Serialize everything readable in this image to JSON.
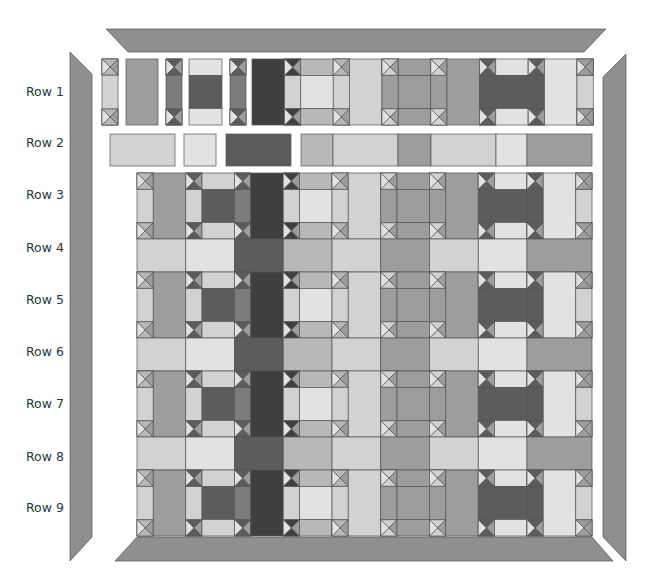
{
  "diagram": {
    "row_labels": [
      "Row 1",
      "Row 2",
      "Row 3",
      "Row 4",
      "Row 5",
      "Row 6",
      "Row 7",
      "Row 8",
      "Row 9"
    ],
    "colors": {
      "darkest": "#3f3f3f",
      "dark": "#5c5c5c",
      "medium_dark": "#7c7c7c",
      "medium": "#9d9d9d",
      "medium_light": "#b8b8b8",
      "light": "#d2d2d2",
      "very_light": "#e2e2e2",
      "border": "#8f8f8f",
      "outline": "#555555"
    },
    "grid": {
      "origin_x": 137,
      "origin_y": 173,
      "unit": 16.25,
      "unit_y": 16.5,
      "column_segments_units": [
        1,
        2,
        1,
        2,
        1,
        2,
        1,
        2,
        1,
        2,
        1,
        2,
        1,
        2,
        1,
        2,
        1,
        2,
        1
      ],
      "block_row_units": 4,
      "sash_row_units": 2
    },
    "block_row_pattern": [
      {
        "type": "sash",
        "fill": "light"
      },
      {
        "type": "vrect",
        "fill": "medium"
      },
      {
        "type": "sash",
        "fill": "light",
        "tri": "dark"
      },
      {
        "type": "block",
        "center": "dark",
        "edge": "light",
        "side": "medium_dark"
      },
      {
        "type": "sash",
        "fill": "medium_dark",
        "tri": "dark"
      },
      {
        "type": "vrect",
        "fill": "darkest"
      },
      {
        "type": "sash",
        "fill": "light",
        "tri": "darkest"
      },
      {
        "type": "block",
        "center": "very_light",
        "edge": "medium_light",
        "side": "light"
      },
      {
        "type": "sash",
        "fill": "light"
      },
      {
        "type": "vrect",
        "fill": "light"
      },
      {
        "type": "sash",
        "fill": "medium",
        "tri": "light"
      },
      {
        "type": "block",
        "center": "medium",
        "edge": "medium",
        "side": "medium"
      },
      {
        "type": "sash",
        "fill": "medium",
        "tri": "light"
      },
      {
        "type": "vrect",
        "fill": "medium"
      },
      {
        "type": "sash",
        "fill": "dark",
        "tri": "dark"
      },
      {
        "type": "block",
        "center": "dark",
        "edge": "very_light",
        "side": "dark"
      },
      {
        "type": "sash",
        "fill": "dark",
        "tri": "dark"
      },
      {
        "type": "vrect",
        "fill": "very_light"
      },
      {
        "type": "sash",
        "fill": "light",
        "tri": "medium"
      }
    ],
    "sash_row_pattern": [
      {
        "span": 2,
        "fill": "light"
      },
      {
        "span": 2,
        "fill": "very_light"
      },
      {
        "span": 2,
        "fill": "dark"
      },
      {
        "span": 2,
        "fill": "medium_light"
      },
      {
        "span": 2,
        "fill": "light"
      },
      {
        "span": 2,
        "fill": "medium"
      },
      {
        "span": 2,
        "fill": "light"
      },
      {
        "span": 2,
        "fill": "very_light"
      },
      {
        "span": 3,
        "fill": "medium"
      }
    ],
    "row1_pieces": [
      {
        "x": 102,
        "w": 16,
        "kind": "sash",
        "fill": "light"
      },
      {
        "x": 126,
        "w": 32,
        "kind": "vrect",
        "fill": "medium"
      },
      {
        "x": 166,
        "w": 16,
        "kind": "sash",
        "fill": "medium_dark",
        "tri": "dark"
      },
      {
        "x": 189,
        "w": 33,
        "kind": "block",
        "center": "dark",
        "edge": "very_light"
      },
      {
        "x": 230,
        "w": 16,
        "kind": "sash",
        "fill": "medium_dark",
        "tri": "dark"
      },
      {
        "x": 252,
        "w": 340,
        "kind": "strip",
        "start_seg": 5
      }
    ],
    "row2_pieces": [
      {
        "x": 110,
        "w": 65,
        "fill": "light"
      },
      {
        "x": 184,
        "w": 32,
        "fill": "very_light"
      },
      {
        "x": 226,
        "w": 65,
        "fill": "dark"
      },
      {
        "x": 301,
        "w": 32,
        "fill": "medium_light"
      },
      {
        "x": 333,
        "w": 65,
        "fill": "light"
      },
      {
        "x": 398,
        "w": 33,
        "fill": "medium"
      },
      {
        "x": 431,
        "w": 65,
        "fill": "light"
      },
      {
        "x": 496,
        "w": 31,
        "fill": "very_light"
      },
      {
        "x": 527,
        "w": 65,
        "fill": "medium"
      }
    ],
    "borders": {
      "top": [
        [
          106,
          29
        ],
        [
          606,
          29
        ],
        [
          584,
          52
        ],
        [
          128,
          52
        ]
      ],
      "bottom": [
        [
          137,
          537
        ],
        [
          592,
          537
        ],
        [
          613,
          561
        ],
        [
          115,
          561
        ]
      ],
      "left": [
        [
          70,
          52
        ],
        [
          92,
          74
        ],
        [
          92,
          537
        ],
        [
          70,
          561
        ]
      ],
      "right": [
        [
          626,
          54
        ],
        [
          626,
          561
        ],
        [
          603,
          537
        ],
        [
          603,
          77
        ]
      ]
    }
  }
}
